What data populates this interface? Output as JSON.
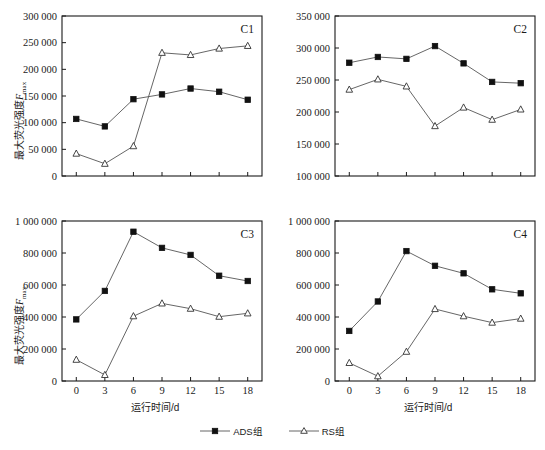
{
  "figure": {
    "xlabel": "运行时间/d",
    "ylabel_prefix": "最大荧光强度",
    "ylabel_symbol": "F",
    "ylabel_subscript": "max",
    "legend": [
      {
        "label": "ADS组",
        "marker": "filled-square",
        "key": "ads"
      },
      {
        "label": "RS组",
        "marker": "open-triangle",
        "key": "rs"
      }
    ]
  },
  "chart_data": [
    {
      "type": "line",
      "title": "C1",
      "xlabel": "运行时间/d",
      "ylabel": "最大荧光强度Fmax",
      "x": [
        0,
        3,
        6,
        9,
        12,
        15,
        18
      ],
      "xticklabels": [
        "0",
        "3",
        "6",
        "9",
        "12",
        "15",
        "18"
      ],
      "xlim": [
        -1.5,
        19.5
      ],
      "ylim": [
        0,
        300000
      ],
      "yticks": [
        0,
        50000,
        100000,
        150000,
        200000,
        250000,
        300000
      ],
      "yticklabels": [
        "0",
        "50 000",
        "100 000",
        "150 000",
        "200 000",
        "250 000",
        "300 000"
      ],
      "grid": false,
      "legend_position": "figure-bottom-center",
      "series": [
        {
          "name": "ADS组",
          "marker": "filled-square",
          "values": [
            107000,
            93000,
            144000,
            153000,
            164000,
            158000,
            143000
          ]
        },
        {
          "name": "RS组",
          "marker": "open-triangle",
          "values": [
            42000,
            23000,
            56000,
            231000,
            227000,
            239000,
            244000
          ]
        }
      ]
    },
    {
      "type": "line",
      "title": "C2",
      "xlabel": "运行时间/d",
      "ylabel": "最大荧光强度Fmax",
      "x": [
        0,
        3,
        6,
        9,
        12,
        15,
        18
      ],
      "xticklabels": [
        "0",
        "3",
        "6",
        "9",
        "12",
        "15",
        "18"
      ],
      "xlim": [
        -1.5,
        19.5
      ],
      "ylim": [
        100000,
        350000
      ],
      "yticks": [
        100000,
        150000,
        200000,
        250000,
        300000,
        350000
      ],
      "yticklabels": [
        "100 000",
        "150 000",
        "200 000",
        "250 000",
        "300 000",
        "350 000"
      ],
      "grid": false,
      "legend_position": "figure-bottom-center",
      "series": [
        {
          "name": "ADS组",
          "marker": "filled-square",
          "values": [
            277000,
            286000,
            283000,
            303000,
            276000,
            247000,
            245000
          ]
        },
        {
          "name": "RS组",
          "marker": "open-triangle",
          "values": [
            235000,
            251000,
            240000,
            178000,
            207000,
            188000,
            204000
          ]
        }
      ]
    },
    {
      "type": "line",
      "title": "C3",
      "xlabel": "运行时间/d",
      "ylabel": "最大荧光强度Fmax",
      "x": [
        0,
        3,
        6,
        9,
        12,
        15,
        18
      ],
      "xticklabels": [
        "0",
        "3",
        "6",
        "9",
        "12",
        "15",
        "18"
      ],
      "xlim": [
        -1.5,
        19.5
      ],
      "ylim": [
        0,
        1000000
      ],
      "yticks": [
        0,
        200000,
        400000,
        600000,
        800000,
        1000000
      ],
      "yticklabels": [
        "0",
        "200 000",
        "400 000",
        "600 000",
        "800 000",
        "1 000 000"
      ],
      "grid": false,
      "legend_position": "figure-bottom-center",
      "series": [
        {
          "name": "ADS组",
          "marker": "filled-square",
          "values": [
            385000,
            563000,
            933000,
            832000,
            788000,
            658000,
            625000
          ]
        },
        {
          "name": "RS组",
          "marker": "open-triangle",
          "values": [
            133000,
            38000,
            405000,
            485000,
            452000,
            402000,
            423000
          ]
        }
      ]
    },
    {
      "type": "line",
      "title": "C4",
      "xlabel": "运行时间/d",
      "ylabel": "最大荧光强度Fmax",
      "x": [
        0,
        3,
        6,
        9,
        12,
        15,
        18
      ],
      "xticklabels": [
        "0",
        "3",
        "6",
        "9",
        "12",
        "15",
        "18"
      ],
      "xlim": [
        -1.5,
        19.5
      ],
      "ylim": [
        0,
        1000000
      ],
      "yticks": [
        0,
        200000,
        400000,
        600000,
        800000,
        1000000
      ],
      "yticklabels": [
        "0",
        "200 000",
        "400 000",
        "600 000",
        "800 000",
        "1 000 000"
      ],
      "grid": false,
      "legend_position": "figure-bottom-center",
      "series": [
        {
          "name": "ADS组",
          "marker": "filled-square",
          "values": [
            313000,
            497000,
            812000,
            720000,
            673000,
            573000,
            548000
          ]
        },
        {
          "name": "RS组",
          "marker": "open-triangle",
          "values": [
            113000,
            30000,
            183000,
            450000,
            405000,
            365000,
            390000
          ]
        }
      ]
    }
  ]
}
